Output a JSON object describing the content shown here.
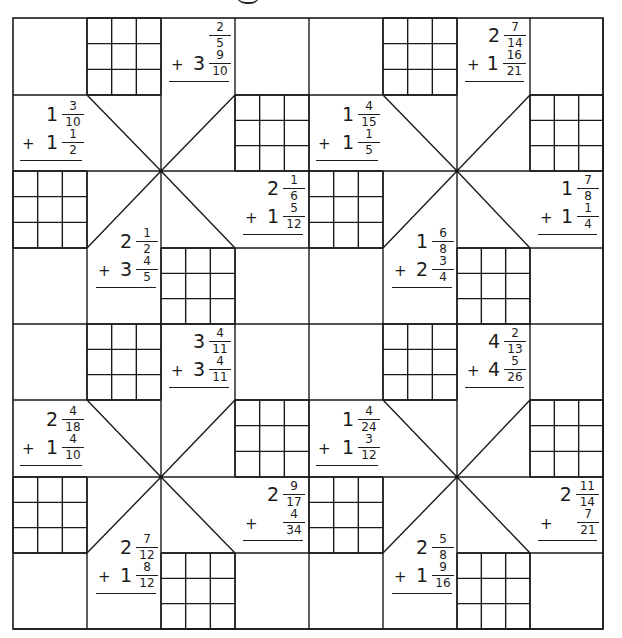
{
  "worksheet": {
    "title_partial": "g",
    "layout": {
      "cols_x": [
        13,
        87,
        161,
        235,
        309,
        383,
        457,
        530,
        603
      ],
      "rows_y": [
        18,
        95,
        171,
        248,
        324,
        400,
        477,
        553,
        629
      ],
      "blocks": [
        {
          "id": "block-top-left",
          "col": 0,
          "row": 0
        },
        {
          "id": "block-top-right",
          "col": 4,
          "row": 0
        },
        {
          "id": "block-bottom-left",
          "col": 0,
          "row": 4
        },
        {
          "id": "block-bottom-right",
          "col": 4,
          "row": 4
        }
      ]
    },
    "problems": [
      {
        "id": "p1",
        "block": 0,
        "slot": "top",
        "a": {
          "whole": "",
          "num": "2",
          "den": "5"
        },
        "b": {
          "whole": "3",
          "num": "9",
          "den": "10"
        },
        "op": "+"
      },
      {
        "id": "p2",
        "block": 0,
        "slot": "left",
        "a": {
          "whole": "1",
          "num": "3",
          "den": "10"
        },
        "b": {
          "whole": "1",
          "num": "1",
          "den": "2"
        },
        "op": "+"
      },
      {
        "id": "p3",
        "block": 0,
        "slot": "right",
        "a": {
          "whole": "2",
          "num": "1",
          "den": "6"
        },
        "b": {
          "whole": "1",
          "num": "5",
          "den": "12"
        },
        "op": "+"
      },
      {
        "id": "p4",
        "block": 0,
        "slot": "bottom",
        "a": {
          "whole": "2",
          "num": "1",
          "den": "2"
        },
        "b": {
          "whole": "3",
          "num": "4",
          "den": "5"
        },
        "op": "+"
      },
      {
        "id": "p5",
        "block": 1,
        "slot": "top",
        "a": {
          "whole": "2",
          "num": "7",
          "den": "14"
        },
        "b": {
          "whole": "1",
          "num": "16",
          "den": "21"
        },
        "op": "+"
      },
      {
        "id": "p6",
        "block": 1,
        "slot": "left",
        "a": {
          "whole": "1",
          "num": "4",
          "den": "15"
        },
        "b": {
          "whole": "1",
          "num": "1",
          "den": "5"
        },
        "op": "+"
      },
      {
        "id": "p7",
        "block": 1,
        "slot": "right",
        "a": {
          "whole": "1",
          "num": "7",
          "den": "8"
        },
        "b": {
          "whole": "1",
          "num": "1",
          "den": "4"
        },
        "op": "+"
      },
      {
        "id": "p8",
        "block": 1,
        "slot": "bottom",
        "a": {
          "whole": "1",
          "num": "6",
          "den": "8"
        },
        "b": {
          "whole": "2",
          "num": "3",
          "den": "4"
        },
        "op": "+"
      },
      {
        "id": "p9",
        "block": 2,
        "slot": "top",
        "a": {
          "whole": "3",
          "num": "4",
          "den": "11"
        },
        "b": {
          "whole": "3",
          "num": "4",
          "den": "11"
        },
        "op": "+"
      },
      {
        "id": "p10",
        "block": 2,
        "slot": "left",
        "a": {
          "whole": "2",
          "num": "4",
          "den": "18"
        },
        "b": {
          "whole": "1",
          "num": "4",
          "den": "10"
        },
        "op": "+"
      },
      {
        "id": "p11",
        "block": 2,
        "slot": "right",
        "a": {
          "whole": "2",
          "num": "9",
          "den": "17"
        },
        "b": {
          "whole": "",
          "num": "4",
          "den": "34"
        },
        "op": "+"
      },
      {
        "id": "p12",
        "block": 2,
        "slot": "bottom",
        "a": {
          "whole": "2",
          "num": "7",
          "den": "12"
        },
        "b": {
          "whole": "1",
          "num": "8",
          "den": "12"
        },
        "op": "+"
      },
      {
        "id": "p13",
        "block": 3,
        "slot": "top",
        "a": {
          "whole": "4",
          "num": "2",
          "den": "13"
        },
        "b": {
          "whole": "4",
          "num": "5",
          "den": "26"
        },
        "op": "+"
      },
      {
        "id": "p14",
        "block": 3,
        "slot": "left",
        "a": {
          "whole": "1",
          "num": "4",
          "den": "24"
        },
        "b": {
          "whole": "1",
          "num": "3",
          "den": "12"
        },
        "op": "+"
      },
      {
        "id": "p15",
        "block": 3,
        "slot": "right",
        "a": {
          "whole": "2",
          "num": "11",
          "den": "14"
        },
        "b": {
          "whole": "",
          "num": "7",
          "den": "21"
        },
        "op": "+"
      },
      {
        "id": "p16",
        "block": 3,
        "slot": "bottom",
        "a": {
          "whole": "2",
          "num": "5",
          "den": "8"
        },
        "b": {
          "whole": "1",
          "num": "9",
          "den": "16"
        },
        "op": "+"
      }
    ],
    "colors": {
      "line": "#1a1a1a",
      "text": "#1c1c1c",
      "background": "#ffffff"
    }
  }
}
